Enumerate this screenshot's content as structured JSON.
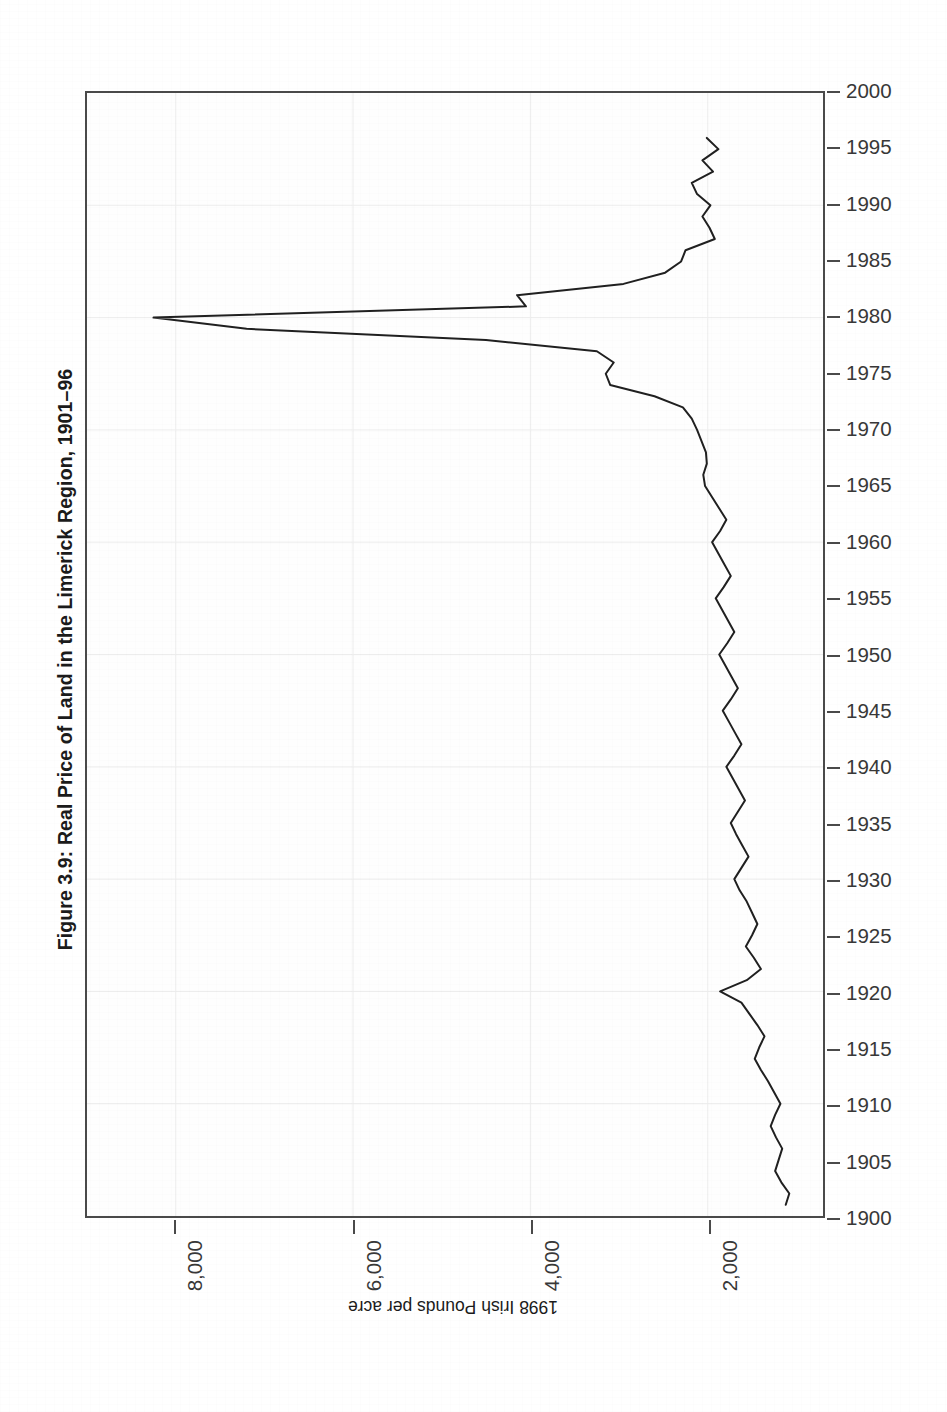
{
  "figure": {
    "title": "Figure 3.9: Real Price of Land in the Limerick Region, 1901–96",
    "value_axis_title": "1998 Irish Pounds per acre",
    "orientation": "rotated-90",
    "line_color": "#202020",
    "frame_color": "#4a4a4a",
    "background": "#ffffff"
  },
  "chart_data": {
    "type": "line",
    "title": "Figure 3.9: Real Price of Land in the Limerick Region, 1901–96",
    "subtitle": "",
    "xlabel": "1998 Irish Pounds per acre",
    "ylabel": "",
    "orientation": "horizontal-rotated",
    "note": "Figure is printed sideways: years run bottom(1900) to top(2000) on the vertical axis; price runs right(low) to left(high) on the horizontal axis.",
    "grid": true,
    "legend": null,
    "legend_position": "none",
    "xlim": [
      9000,
      700
    ],
    "ylim": [
      1900,
      2000
    ],
    "x_ticks": [
      8000,
      6000,
      4000,
      2000
    ],
    "x_tick_labels": [
      "8,000",
      "6,000",
      "4,000",
      "2,000"
    ],
    "y_ticks": [
      1900,
      1905,
      1910,
      1915,
      1920,
      1925,
      1930,
      1935,
      1940,
      1945,
      1950,
      1955,
      1960,
      1965,
      1970,
      1975,
      1980,
      1985,
      1990,
      1995,
      2000
    ],
    "y_tick_labels": [
      "1900",
      "1905",
      "1910",
      "1915",
      "1920",
      "1925",
      "1930",
      "1935",
      "1940",
      "1945",
      "1950",
      "1955",
      "1960",
      "1965",
      "1970",
      "1975",
      "1980",
      "1985",
      "1990",
      "1995",
      "2000"
    ],
    "series": [
      {
        "name": "Real price of land, Limerick region",
        "units": "1998 Irish Pounds per acre",
        "x": [
          1901,
          1902,
          1903,
          1904,
          1905,
          1906,
          1907,
          1908,
          1909,
          1910,
          1911,
          1912,
          1913,
          1914,
          1915,
          1916,
          1917,
          1918,
          1919,
          1920,
          1921,
          1922,
          1923,
          1924,
          1925,
          1926,
          1927,
          1928,
          1929,
          1930,
          1931,
          1932,
          1933,
          1934,
          1935,
          1936,
          1937,
          1938,
          1939,
          1940,
          1941,
          1942,
          1943,
          1944,
          1945,
          1946,
          1947,
          1948,
          1949,
          1950,
          1951,
          1952,
          1953,
          1954,
          1955,
          1956,
          1957,
          1958,
          1959,
          1960,
          1961,
          1962,
          1963,
          1964,
          1965,
          1966,
          1967,
          1968,
          1969,
          1970,
          1971,
          1972,
          1973,
          1974,
          1975,
          1976,
          1977,
          1978,
          1979,
          1980,
          1981,
          1982,
          1983,
          1984,
          1985,
          1986,
          1987,
          1988,
          1989,
          1990,
          1991,
          1992,
          1993,
          1994,
          1995,
          1996
        ],
        "y": [
          1120,
          1080,
          1170,
          1240,
          1200,
          1160,
          1230,
          1290,
          1240,
          1180,
          1250,
          1320,
          1400,
          1470,
          1420,
          1360,
          1440,
          1530,
          1620,
          1860,
          1560,
          1400,
          1480,
          1570,
          1500,
          1440,
          1500,
          1560,
          1640,
          1700,
          1620,
          1540,
          1610,
          1680,
          1740,
          1660,
          1580,
          1650,
          1720,
          1790,
          1700,
          1620,
          1690,
          1760,
          1830,
          1740,
          1660,
          1730,
          1800,
          1870,
          1780,
          1700,
          1770,
          1840,
          1910,
          1820,
          1740,
          1810,
          1880,
          1950,
          1860,
          1790,
          1870,
          1950,
          2030,
          2050,
          2010,
          2020,
          2070,
          2120,
          2180,
          2280,
          2600,
          3100,
          3150,
          3060,
          3250,
          4500,
          7200,
          8250,
          4050,
          4150,
          2950,
          2480,
          2300,
          2250,
          1920,
          1980,
          2060,
          1970,
          2120,
          2180,
          1940,
          2060,
          1880,
          2010
        ]
      }
    ],
    "annotations": [
      {
        "text": "Peak of the land-price boom",
        "year": 1980,
        "value": 8250
      },
      {
        "text": "Post-WWI spike",
        "year": 1920,
        "value": 1860
      }
    ]
  },
  "year_axis": {
    "ticks": [
      {
        "label": "2000",
        "year": 2000
      },
      {
        "label": "1995",
        "year": 1995
      },
      {
        "label": "1990",
        "year": 1990
      },
      {
        "label": "1985",
        "year": 1985
      },
      {
        "label": "1980",
        "year": 1980
      },
      {
        "label": "1975",
        "year": 1975
      },
      {
        "label": "1970",
        "year": 1970
      },
      {
        "label": "1965",
        "year": 1965
      },
      {
        "label": "1960",
        "year": 1960
      },
      {
        "label": "1955",
        "year": 1955
      },
      {
        "label": "1950",
        "year": 1950
      },
      {
        "label": "1945",
        "year": 1945
      },
      {
        "label": "1940",
        "year": 1940
      },
      {
        "label": "1935",
        "year": 1935
      },
      {
        "label": "1930",
        "year": 1930
      },
      {
        "label": "1925",
        "year": 1925
      },
      {
        "label": "1920",
        "year": 1920
      },
      {
        "label": "1915",
        "year": 1915
      },
      {
        "label": "1910",
        "year": 1910
      },
      {
        "label": "1905",
        "year": 1905
      },
      {
        "label": "1900",
        "year": 1900
      }
    ]
  },
  "value_axis": {
    "ticks": [
      {
        "label": "8,000",
        "value": 8000
      },
      {
        "label": "6,000",
        "value": 6000
      },
      {
        "label": "4,000",
        "value": 4000
      },
      {
        "label": "2,000",
        "value": 2000
      }
    ]
  }
}
